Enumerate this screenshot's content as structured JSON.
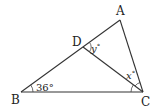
{
  "figure": {
    "type": "triangle-geometry",
    "points": {
      "A": {
        "label": "A",
        "x": 120,
        "y": 20
      },
      "B": {
        "label": "B",
        "x": 21,
        "y": 92
      },
      "C": {
        "label": "C",
        "x": 143,
        "y": 92
      },
      "D": {
        "label": "D",
        "x": 83,
        "y": 47
      }
    },
    "segments": [
      "AB",
      "BC",
      "CA",
      "DC"
    ],
    "angles": {
      "angle_B": {
        "label": "36°",
        "at": "B"
      },
      "angle_y": {
        "var": "y",
        "deg": "°",
        "at": "D"
      },
      "angle_x": {
        "var": "x",
        "deg": "°",
        "at": "C"
      }
    },
    "colors": {
      "stroke": "#333333",
      "text": "#222222",
      "background": "#ffffff"
    }
  }
}
